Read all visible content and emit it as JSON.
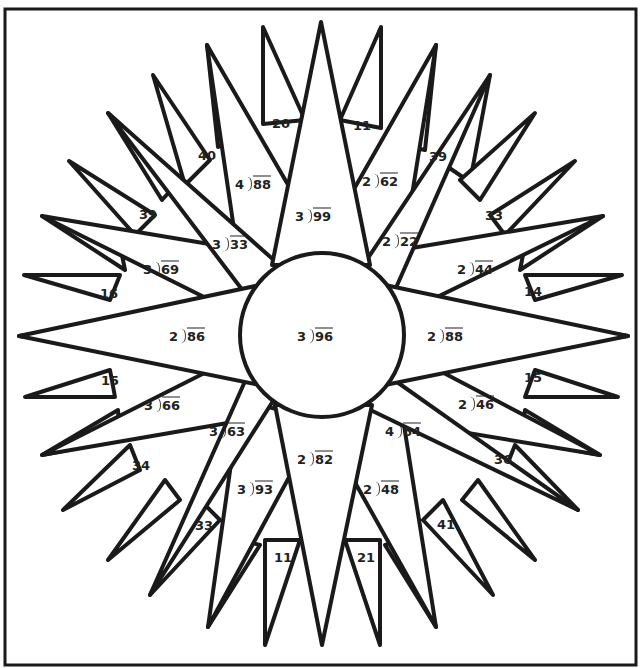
{
  "worksheet": {
    "title": "Compass rose division color-by-number",
    "center": {
      "divisor": "3",
      "dividend": "96"
    },
    "large_points": [
      {
        "position": "north",
        "divisor": "3",
        "dividend": "99"
      },
      {
        "position": "east",
        "divisor": "2",
        "dividend": "88"
      },
      {
        "position": "south",
        "divisor": "2",
        "dividend": "82"
      },
      {
        "position": "west",
        "divisor": "2",
        "dividend": "86"
      }
    ],
    "medium_points": [
      {
        "position": "north-east",
        "divisor": "2",
        "dividend": "22"
      },
      {
        "position": "south-east",
        "divisor": "4",
        "dividend": "84"
      },
      {
        "position": "south-west",
        "divisor": "3",
        "dividend": "63"
      },
      {
        "position": "north-west",
        "divisor": "3",
        "dividend": "33"
      }
    ],
    "small_points": [
      {
        "position": "nnw",
        "divisor": "4",
        "dividend": "88"
      },
      {
        "position": "nne",
        "divisor": "2",
        "dividend": "62"
      },
      {
        "position": "ene",
        "divisor": "2",
        "dividend": "44"
      },
      {
        "position": "ese",
        "divisor": "2",
        "dividend": "46"
      },
      {
        "position": "sse",
        "divisor": "2",
        "dividend": "48"
      },
      {
        "position": "ssw",
        "divisor": "3",
        "dividend": "93"
      },
      {
        "position": "wsw",
        "divisor": "3",
        "dividend": "66"
      },
      {
        "position": "wnw",
        "divisor": "3",
        "dividend": "69"
      }
    ],
    "answer_regions": [
      {
        "id": "n-left",
        "value": "20"
      },
      {
        "id": "n-right",
        "value": "11"
      },
      {
        "id": "nne-outer",
        "value": "39"
      },
      {
        "id": "ne-outer",
        "value": "33"
      },
      {
        "id": "e-upper",
        "value": "14"
      },
      {
        "id": "e-lower",
        "value": "15"
      },
      {
        "id": "se-outer",
        "value": "36"
      },
      {
        "id": "sse-outer",
        "value": "41"
      },
      {
        "id": "s-right",
        "value": "21"
      },
      {
        "id": "s-left",
        "value": "11"
      },
      {
        "id": "ssw-outer",
        "value": "33"
      },
      {
        "id": "sw-outer",
        "value": "34"
      },
      {
        "id": "w-lower",
        "value": "15"
      },
      {
        "id": "w-upper",
        "value": "16"
      },
      {
        "id": "nw-outer",
        "value": "39"
      },
      {
        "id": "nnw-outer",
        "value": "40"
      }
    ],
    "colors": {
      "line": "#1a1a1a",
      "background": "#ffffff"
    }
  }
}
